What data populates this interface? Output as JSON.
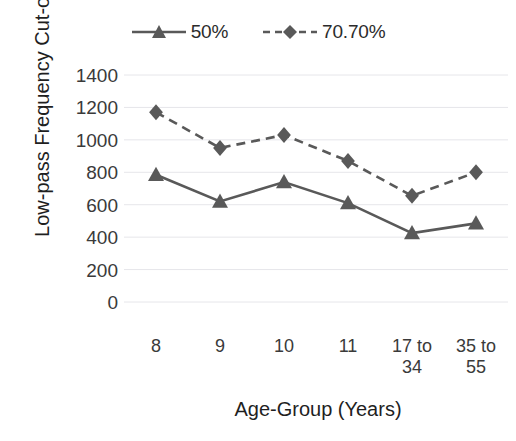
{
  "chart_data": {
    "type": "line",
    "title": "",
    "xlabel": "Age-Group (Years)",
    "ylabel": "Low-pass Frequency Cut-off",
    "categories": [
      "8",
      "9",
      "10",
      "11",
      "17 to 34",
      "35 to 55"
    ],
    "category_lines": [
      [
        "8"
      ],
      [
        "9"
      ],
      [
        "10"
      ],
      [
        "11"
      ],
      [
        "17 to",
        "34"
      ],
      [
        "35 to",
        "55"
      ]
    ],
    "series": [
      {
        "name": "50%",
        "marker": "triangle",
        "linestyle": "solid",
        "color": "#595959",
        "values": [
          785,
          620,
          740,
          610,
          425,
          485
        ]
      },
      {
        "name": "70.70%",
        "marker": "diamond",
        "linestyle": "dashed",
        "color": "#595959",
        "values": [
          1170,
          950,
          1030,
          870,
          655,
          800
        ]
      }
    ],
    "ylim": [
      0,
      1400
    ],
    "ytick_values": [
      0,
      200,
      400,
      600,
      800,
      1000,
      1200,
      1400
    ],
    "ytick_labels": [
      "0",
      "200",
      "400",
      "600",
      "800",
      "1000",
      "1200",
      "1400"
    ],
    "grid": true,
    "grid_color": "#e6e6ea",
    "legend_position": "top-center"
  },
  "legend": {
    "entries": [
      {
        "label": "50%",
        "marker": "triangle-icon",
        "dash": "solid"
      },
      {
        "label": "70.70%",
        "marker": "diamond-icon",
        "dash": "dashed"
      }
    ]
  },
  "axes": {
    "x_title": "Age-Group (Years)",
    "y_title": "Low-pass Frequency Cut-off"
  }
}
